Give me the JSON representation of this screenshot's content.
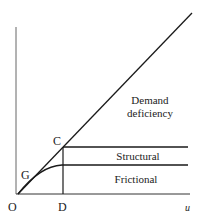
{
  "diagram": {
    "labels": {
      "origin": "O",
      "point_g": "G",
      "point_c": "C",
      "point_d": "D",
      "x_axis": "u",
      "demand_line1": "Demand",
      "demand_line2": "deficiency",
      "structural": "Structural",
      "frictional": "Frictional"
    },
    "colors": {
      "line": "#1a1a1a",
      "axis": "#555555",
      "text": "#222222"
    }
  }
}
